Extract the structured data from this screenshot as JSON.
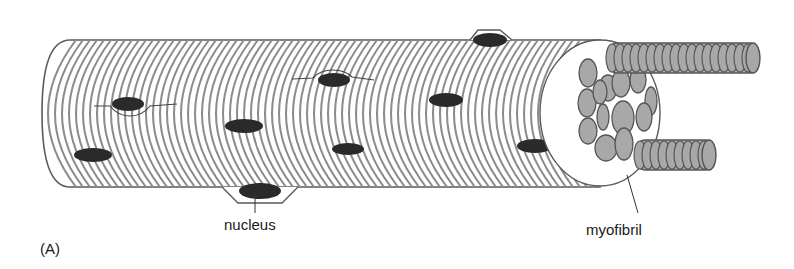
{
  "figure": {
    "panel_label": "(A)",
    "labels": {
      "nucleus": "nucleus",
      "myofibril": "myofibril"
    }
  },
  "colors": {
    "outline": "#5a5a5a",
    "stripe": "#8c8c8c",
    "nucleus_fill": "#2a2a2a",
    "myofibril_fill": "#a8a8a8",
    "myofibril_stroke": "#555555",
    "background": "#ffffff"
  },
  "geometry": {
    "tube": {
      "x0": 42,
      "x1": 600,
      "top": 40,
      "bottom": 187
    },
    "stripe_spacing": 7,
    "nuclei": [
      {
        "cx": 93,
        "cy": 155,
        "rx": 19,
        "ry": 7
      },
      {
        "cx": 128,
        "cy": 104,
        "rx": 16,
        "ry": 7
      },
      {
        "cx": 244,
        "cy": 126,
        "rx": 19,
        "ry": 7
      },
      {
        "cx": 334,
        "cy": 80,
        "rx": 16,
        "ry": 7
      },
      {
        "cx": 348,
        "cy": 149,
        "rx": 16,
        "ry": 6
      },
      {
        "cx": 446,
        "cy": 100,
        "rx": 17,
        "ry": 7
      },
      {
        "cx": 490,
        "cy": 40,
        "rx": 17,
        "ry": 7
      },
      {
        "cx": 535,
        "cy": 146,
        "rx": 18,
        "ry": 7
      },
      {
        "cx": 260,
        "cy": 191,
        "rx": 21,
        "ry": 8
      }
    ]
  }
}
